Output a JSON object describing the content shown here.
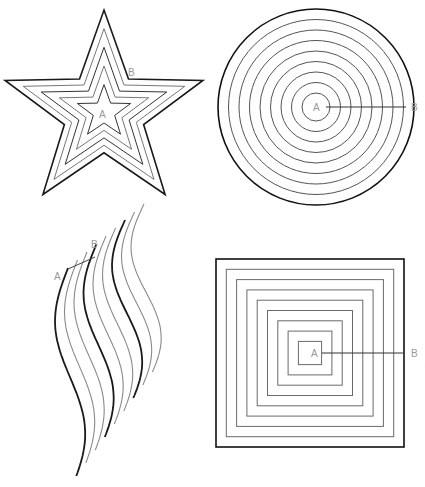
{
  "figures": [
    {
      "id": "star",
      "shape": "concentric-stars",
      "label_a": "A",
      "label_b": "B",
      "rings": 5,
      "colors": {
        "outer": "#1a1a1a",
        "inner": "#5a5a5a"
      }
    },
    {
      "id": "circle",
      "shape": "concentric-circles",
      "label_a": "A",
      "label_b": "B",
      "rings": 9,
      "colors": {
        "outer": "#111111",
        "inner": "#555555"
      }
    },
    {
      "id": "waves",
      "shape": "parallel-wavy-lines",
      "label_a": "A",
      "label_b": "B",
      "lines": 9,
      "colors": {
        "bold": "#1a1a1a",
        "light": "#8a8a8a"
      }
    },
    {
      "id": "square",
      "shape": "concentric-squares",
      "label_a": "A",
      "label_b": "B",
      "rings": 9,
      "colors": {
        "outer": "#111111",
        "inner": "#6a6a6a"
      }
    }
  ]
}
